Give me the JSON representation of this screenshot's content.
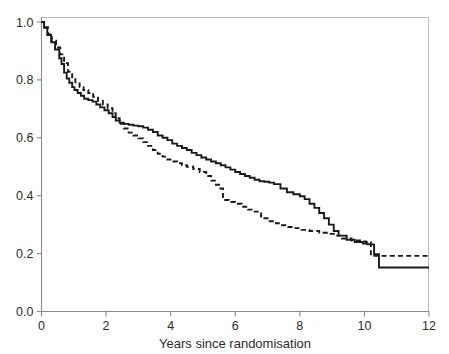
{
  "chart_data": {
    "type": "line",
    "title": "",
    "subtitle": "",
    "xlabel": "Years since randomisation",
    "ylabel": "",
    "xlim": [
      0,
      12
    ],
    "ylim": [
      0,
      1.0
    ],
    "xticks": [
      "0",
      "2",
      "4",
      "6",
      "8",
      "10",
      "12"
    ],
    "xtick_values": [
      0,
      2,
      4,
      6,
      8,
      10,
      12
    ],
    "yticks": [
      "0.0",
      "0.2",
      "0.4",
      "0.6",
      "0.8",
      "1.0"
    ],
    "ytick_values": [
      0.0,
      0.2,
      0.4,
      0.6,
      0.8,
      1.0
    ],
    "grid": false,
    "legend": "none",
    "plot_style": "kaplan-meier step survival curves",
    "series": [
      {
        "name": "solid-curve",
        "style": "solid",
        "color": "#1a1a1a",
        "x": [
          0,
          0.08,
          0.18,
          0.3,
          0.42,
          0.55,
          0.62,
          0.7,
          0.78,
          0.86,
          0.95,
          1.02,
          1.12,
          1.22,
          1.32,
          1.45,
          1.58,
          1.7,
          1.82,
          1.95,
          2.08,
          2.2,
          2.3,
          2.42,
          2.55,
          2.7,
          2.85,
          3.0,
          3.15,
          3.3,
          3.45,
          3.6,
          3.75,
          3.9,
          4.05,
          4.2,
          4.35,
          4.5,
          4.65,
          4.8,
          4.95,
          5.1,
          5.25,
          5.4,
          5.55,
          5.7,
          5.85,
          6.0,
          6.15,
          6.3,
          6.45,
          6.6,
          6.75,
          6.9,
          7.05,
          7.2,
          7.4,
          7.6,
          7.8,
          8.0,
          8.15,
          8.3,
          8.45,
          8.6,
          8.75,
          8.9,
          9.05,
          9.2,
          9.45,
          9.7,
          9.95,
          10.1,
          10.3,
          10.45,
          11.0,
          12.0
        ],
        "y": [
          1.0,
          0.98,
          0.955,
          0.93,
          0.905,
          0.875,
          0.855,
          0.825,
          0.805,
          0.79,
          0.775,
          0.765,
          0.755,
          0.745,
          0.735,
          0.73,
          0.725,
          0.715,
          0.705,
          0.695,
          0.685,
          0.672,
          0.66,
          0.652,
          0.648,
          0.645,
          0.642,
          0.64,
          0.635,
          0.628,
          0.62,
          0.608,
          0.6,
          0.592,
          0.58,
          0.572,
          0.565,
          0.558,
          0.548,
          0.54,
          0.532,
          0.525,
          0.518,
          0.512,
          0.505,
          0.498,
          0.49,
          0.482,
          0.475,
          0.468,
          0.462,
          0.455,
          0.45,
          0.448,
          0.445,
          0.44,
          0.425,
          0.412,
          0.405,
          0.398,
          0.388,
          0.372,
          0.358,
          0.34,
          0.322,
          0.3,
          0.278,
          0.262,
          0.248,
          0.24,
          0.235,
          0.232,
          0.198,
          0.152,
          0.152,
          0.152
        ]
      },
      {
        "name": "dashed-curve",
        "style": "dashed",
        "color": "#1a1a1a",
        "x": [
          0,
          0.08,
          0.2,
          0.32,
          0.45,
          0.58,
          0.7,
          0.82,
          0.95,
          1.05,
          1.18,
          1.3,
          1.45,
          1.6,
          1.75,
          1.9,
          2.05,
          2.2,
          2.3,
          2.42,
          2.55,
          2.7,
          2.85,
          3.0,
          3.15,
          3.3,
          3.45,
          3.6,
          3.75,
          3.9,
          4.05,
          4.2,
          4.35,
          4.5,
          4.7,
          4.9,
          5.1,
          5.25,
          5.4,
          5.5,
          5.62,
          5.8,
          6.0,
          6.2,
          6.4,
          6.6,
          6.8,
          7.0,
          7.2,
          7.35,
          7.55,
          7.8,
          8.05,
          8.3,
          8.6,
          8.9,
          9.1,
          9.3,
          9.6,
          9.9,
          10.05,
          10.2,
          10.4,
          11.0,
          12.0
        ],
        "y": [
          1.0,
          0.982,
          0.958,
          0.935,
          0.912,
          0.888,
          0.858,
          0.828,
          0.802,
          0.788,
          0.775,
          0.765,
          0.755,
          0.742,
          0.728,
          0.715,
          0.702,
          0.685,
          0.668,
          0.648,
          0.632,
          0.618,
          0.608,
          0.598,
          0.585,
          0.572,
          0.558,
          0.545,
          0.535,
          0.525,
          0.518,
          0.512,
          0.505,
          0.5,
          0.492,
          0.482,
          0.468,
          0.452,
          0.438,
          0.425,
          0.385,
          0.378,
          0.372,
          0.362,
          0.352,
          0.345,
          0.322,
          0.312,
          0.305,
          0.298,
          0.292,
          0.288,
          0.282,
          0.278,
          0.272,
          0.268,
          0.262,
          0.252,
          0.245,
          0.242,
          0.24,
          0.192,
          0.192,
          0.192,
          0.192
        ]
      }
    ]
  },
  "axes": {
    "x_title": "Years since randomisation"
  }
}
